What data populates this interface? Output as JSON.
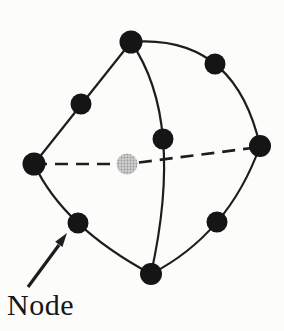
{
  "figure": {
    "label": "Node",
    "background": "#fcfcfb",
    "ink": "#1d1d1d",
    "node_fill": "#151515",
    "hidden_node_tone": "#b5b5b5",
    "element_type": "quadratic-tetrahedron-10-node",
    "nodes": [
      {
        "id": "corner-top",
        "x": 131,
        "y": 42,
        "r": 11.5,
        "type": "visible"
      },
      {
        "id": "corner-left",
        "x": 34,
        "y": 164,
        "r": 11.5,
        "type": "visible"
      },
      {
        "id": "corner-right",
        "x": 260,
        "y": 146,
        "r": 11,
        "type": "visible"
      },
      {
        "id": "corner-bottom",
        "x": 151,
        "y": 274,
        "r": 11,
        "type": "visible"
      },
      {
        "id": "mid-top-left",
        "x": 81,
        "y": 104,
        "r": 10.5,
        "type": "visible"
      },
      {
        "id": "mid-top-right",
        "x": 215,
        "y": 64,
        "r": 10.5,
        "type": "visible"
      },
      {
        "id": "mid-left-bottom",
        "x": 78,
        "y": 223,
        "r": 10.5,
        "type": "visible"
      },
      {
        "id": "mid-right-bottom",
        "x": 217,
        "y": 222,
        "r": 10.5,
        "type": "visible"
      },
      {
        "id": "mid-front",
        "x": 163,
        "y": 139,
        "r": 10.5,
        "type": "visible"
      },
      {
        "id": "mid-hidden",
        "x": 127,
        "y": 164,
        "r": 10.5,
        "type": "hidden"
      }
    ],
    "edges": [
      {
        "id": "top-left",
        "path": "M 131 42 L 34 164",
        "style": "solid"
      },
      {
        "id": "top-right",
        "path": "M 131 42 Q 234.5 34 260 146",
        "style": "solid"
      },
      {
        "id": "left-bottom",
        "path": "M 34 164 Q 63.5 227 151 274",
        "style": "solid"
      },
      {
        "id": "right-bottom",
        "path": "M 260 146 Q 228.5 234 151 274",
        "style": "solid"
      },
      {
        "id": "front",
        "path": "M 131 42 Q 185 120 151 274",
        "style": "solid"
      },
      {
        "id": "hidden",
        "path": "M 34 164 L 127 164 L 260 147",
        "style": "dashed"
      }
    ],
    "arrow": {
      "shaft": "M 28 287 L 59 245",
      "head": "67,233 62.4,246.9 55.2,241.7"
    }
  }
}
